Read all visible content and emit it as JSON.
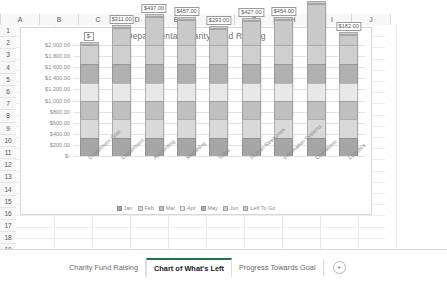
{
  "grid": {
    "columns": [
      "A",
      "B",
      "C",
      "D",
      "E",
      "F",
      "G",
      "H",
      "I",
      "J"
    ],
    "rows": [
      "1",
      "2",
      "3",
      "4",
      "5",
      "6",
      "7",
      "8",
      "9",
      "10",
      "11",
      "12",
      "13",
      "14",
      "15",
      "16",
      "17",
      "18",
      "19",
      "20"
    ],
    "select_all_icon": "select-all-triangle-icon"
  },
  "sheet_tabs": {
    "tabs": [
      {
        "label": "Charity Fund Raising",
        "active": false
      },
      {
        "label": "Chart of What's Left",
        "active": true
      },
      {
        "label": "Progress Towards Goal",
        "active": false
      }
    ],
    "add_sheet_label": "+",
    "add_sheet_icon": "plus-circle-icon"
  },
  "chart_data": {
    "type": "bar",
    "title": "Departmental Charity Fund Raising",
    "xlabel": "",
    "ylabel": "",
    "ylim": [
      0,
      2000
    ],
    "grid": true,
    "legend_position": "bottom",
    "ytick_labels": [
      "$2,000.00",
      "$1,800.00",
      "$1,600.00",
      "$1,400.00",
      "$1,200.00",
      "$1,000.00",
      "$800.00",
      "$600.00",
      "$400.00",
      "$200.00",
      "$-"
    ],
    "ytick_values": [
      2000,
      1800,
      1600,
      1400,
      1200,
      1000,
      800,
      600,
      400,
      200,
      0
    ],
    "categories": [
      "Department Goal",
      "Department",
      "Accounting",
      "Marketing",
      "Sales",
      "Human Resources",
      "Information Systems",
      "Operations",
      "Logistics"
    ],
    "data_labels": [
      "$-",
      "$311.00",
      "$497.00",
      "$457.00",
      "$293.00",
      "$427.00",
      "$454.00",
      "$740.00",
      "$182.00"
    ],
    "data_label_values": [
      0,
      311,
      497,
      457,
      293,
      427,
      454,
      740,
      182
    ],
    "series": [
      {
        "name": "Jan",
        "color": "#a6a6a6",
        "values": [
          330,
          330,
          330,
          330,
          330,
          330,
          330,
          330,
          330
        ]
      },
      {
        "name": "Feb",
        "color": "#d9d9d9",
        "values": [
          330,
          330,
          330,
          330,
          330,
          330,
          330,
          330,
          330
        ]
      },
      {
        "name": "Mar",
        "color": "#bfbfbf",
        "values": [
          330,
          330,
          330,
          330,
          330,
          330,
          330,
          330,
          330
        ]
      },
      {
        "name": "Apr",
        "color": "#e8e8e8",
        "values": [
          330,
          330,
          330,
          330,
          330,
          330,
          330,
          330,
          330
        ]
      },
      {
        "name": "May",
        "color": "#b0b0b0",
        "values": [
          330,
          330,
          330,
          330,
          330,
          330,
          330,
          330,
          330
        ]
      },
      {
        "name": "Jun",
        "color": "#cfcfcf",
        "values": [
          350,
          350,
          350,
          350,
          350,
          350,
          350,
          350,
          350
        ]
      },
      {
        "name": "Left To Go",
        "color": "#c9c9c9",
        "values": [
          0,
          311,
          497,
          457,
          293,
          427,
          454,
          740,
          182
        ]
      }
    ]
  }
}
